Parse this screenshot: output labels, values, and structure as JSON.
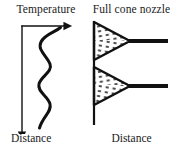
{
  "figure": {
    "type": "schematic-diagram",
    "background_color": "#ffffff",
    "stroke_color": "#111111",
    "width_px": 175,
    "height_px": 151
  },
  "panels": [
    {
      "id": "temperature-profile",
      "title": "Temperature",
      "axis_label_bottom": "Distance",
      "description": "Vertical downward arrow axis labelled Distance with a wavy temperature profile curve and a horizontal arrow at the top labelled Temperature",
      "curve": {
        "name": "temperature-wave",
        "shape": "sinusoidal",
        "oscillations": 3,
        "stroke_width_px": 3
      },
      "arrows": [
        {
          "name": "temperature-arrow",
          "direction": "right"
        },
        {
          "name": "distance-arrow",
          "direction": "down"
        }
      ]
    },
    {
      "id": "full-cone-nozzle",
      "title": "Full cone nozzle",
      "axis_label_bottom": "Distance",
      "description": "Vertical wall line with two full cone spray patterns drawn as dotted triangles, each fed by a horizontal nozzle lance entering from the right",
      "nozzles": [
        {
          "name": "nozzle-upper",
          "spray_pattern": "full-cone"
        },
        {
          "name": "nozzle-lower",
          "spray_pattern": "full-cone"
        }
      ]
    }
  ]
}
